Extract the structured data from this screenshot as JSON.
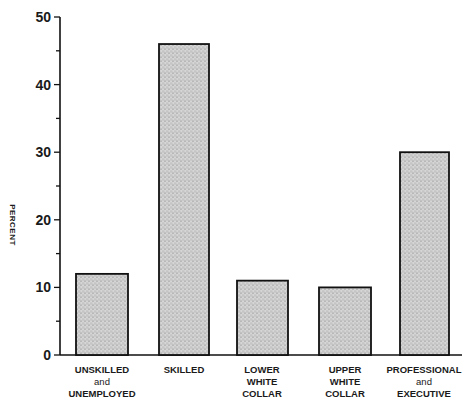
{
  "chart_data": {
    "type": "bar",
    "title": "",
    "xlabel": "",
    "ylabel": "PERCENT",
    "ylim": [
      0,
      50
    ],
    "yticks": [
      0,
      10,
      20,
      30,
      40,
      50
    ],
    "minor_ytick_step": 5,
    "grid": false,
    "categories": [
      "UNSKILLED and UNEMPLOYED",
      "SKILLED",
      "LOWER WHITE COLLAR",
      "UPPER WHITE COLLAR",
      "PROFESSIONAL and EXECUTIVE"
    ],
    "values": [
      12,
      46,
      11,
      10,
      30
    ],
    "bar_style": "stippled gray fill with black outline"
  },
  "labels": {
    "ylabel": "PERCENT",
    "yticks": [
      "0",
      "10",
      "20",
      "30",
      "40",
      "50"
    ],
    "cat0": [
      "UNSKILLED",
      "and",
      "UNEMPLOYED"
    ],
    "cat1": [
      "SKILLED"
    ],
    "cat2": [
      "LOWER",
      "WHITE",
      "COLLAR"
    ],
    "cat3": [
      "UPPER",
      "WHITE",
      "COLLAR"
    ],
    "cat4": [
      "PROFESSIONAL",
      "and",
      "EXECUTIVE"
    ]
  },
  "colors": {
    "bar_fill": "#c8c8c8",
    "bar_stroke": "#111111",
    "axis": "#111111"
  }
}
